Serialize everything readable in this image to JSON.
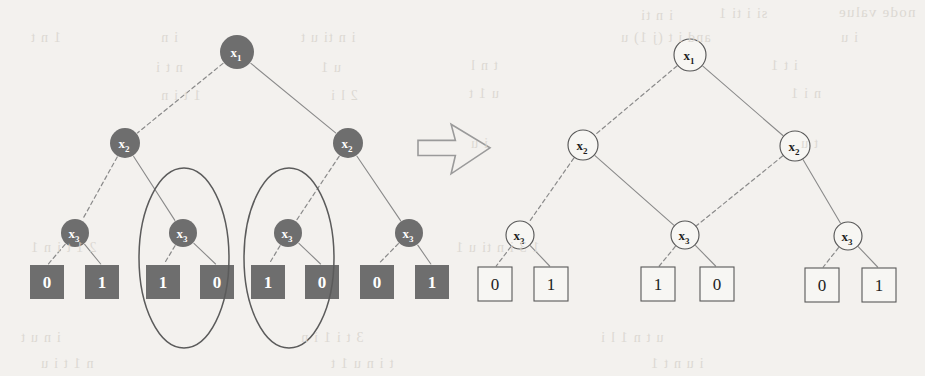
{
  "figure": {
    "colors": {
      "page_background": "#f3f1ee",
      "filled_node": "#6e6e6e",
      "filled_node_text": "#ffffff",
      "hollow_node_stroke": "#585858",
      "hollow_node_text": "#1d1d1d",
      "edge": "#8a8a8a",
      "ellipse_stroke": "#5b5b5b",
      "arrow_stroke": "#9a9a9a",
      "ghost_text": "#d9d5cf"
    },
    "arrow": {
      "name": "transform-arrow",
      "glyph": "right-arrow",
      "x": 418,
      "y": 122,
      "width": 72,
      "height": 54
    },
    "left_tree": {
      "name": "unreduced-decision-tree",
      "style": "filled",
      "nodes": [
        {
          "id": "L_root",
          "label": "x",
          "sub": "1",
          "cx": 237,
          "cy": 52,
          "r": 17
        },
        {
          "id": "L_x2a",
          "label": "x",
          "sub": "2",
          "cx": 125,
          "cy": 143,
          "r": 15
        },
        {
          "id": "L_x2b",
          "label": "x",
          "sub": "2",
          "cx": 348,
          "cy": 143,
          "r": 15
        },
        {
          "id": "L_x3a",
          "label": "x",
          "sub": "3",
          "cx": 75,
          "cy": 233,
          "r": 14
        },
        {
          "id": "L_x3b",
          "label": "x",
          "sub": "3",
          "cx": 183,
          "cy": 233,
          "r": 14
        },
        {
          "id": "L_x3c",
          "label": "x",
          "sub": "3",
          "cx": 288,
          "cy": 233,
          "r": 14
        },
        {
          "id": "L_x3d",
          "label": "x",
          "sub": "3",
          "cx": 409,
          "cy": 233,
          "r": 14
        }
      ],
      "leaves": [
        {
          "id": "L_t0",
          "value": "0",
          "x": 30,
          "y": 265,
          "w": 34,
          "h": 34
        },
        {
          "id": "L_t1",
          "value": "1",
          "x": 85,
          "y": 265,
          "w": 34,
          "h": 34
        },
        {
          "id": "L_t2",
          "value": "1",
          "x": 146,
          "y": 265,
          "w": 34,
          "h": 34
        },
        {
          "id": "L_t3",
          "value": "0",
          "x": 200,
          "y": 265,
          "w": 34,
          "h": 34
        },
        {
          "id": "L_t4",
          "value": "1",
          "x": 251,
          "y": 265,
          "w": 34,
          "h": 34
        },
        {
          "id": "L_t5",
          "value": "0",
          "x": 305,
          "y": 265,
          "w": 34,
          "h": 34
        },
        {
          "id": "L_t6",
          "value": "0",
          "x": 360,
          "y": 265,
          "w": 34,
          "h": 34
        },
        {
          "id": "L_t7",
          "value": "1",
          "x": 415,
          "y": 265,
          "w": 34,
          "h": 34
        }
      ],
      "edges": [
        {
          "from": "L_root",
          "to": "L_x2a",
          "style": "dashed",
          "branch": "0"
        },
        {
          "from": "L_root",
          "to": "L_x2b",
          "style": "solid",
          "branch": "1"
        },
        {
          "from": "L_x2a",
          "to": "L_x3a",
          "style": "dashed",
          "branch": "0"
        },
        {
          "from": "L_x2a",
          "to": "L_x3b",
          "style": "solid",
          "branch": "1"
        },
        {
          "from": "L_x2b",
          "to": "L_x3c",
          "style": "dashed",
          "branch": "0"
        },
        {
          "from": "L_x2b",
          "to": "L_x3d",
          "style": "solid",
          "branch": "1"
        },
        {
          "from": "L_x3a",
          "to": "L_t0",
          "style": "dashed",
          "branch": "0"
        },
        {
          "from": "L_x3a",
          "to": "L_t1",
          "style": "solid",
          "branch": "1"
        },
        {
          "from": "L_x3b",
          "to": "L_t2",
          "style": "dashed",
          "branch": "0"
        },
        {
          "from": "L_x3b",
          "to": "L_t3",
          "style": "solid",
          "branch": "1"
        },
        {
          "from": "L_x3c",
          "to": "L_t4",
          "style": "dashed",
          "branch": "0"
        },
        {
          "from": "L_x3c",
          "to": "L_t5",
          "style": "solid",
          "branch": "1"
        },
        {
          "from": "L_x3d",
          "to": "L_t6",
          "style": "dashed",
          "branch": "0"
        },
        {
          "from": "L_x3d",
          "to": "L_t7",
          "style": "solid",
          "branch": "1"
        }
      ],
      "highlight_ellipses": [
        {
          "id": "ellipse-left",
          "cx": 184,
          "cy": 258,
          "rx": 45,
          "ry": 90
        },
        {
          "id": "ellipse-right",
          "cx": 289,
          "cy": 258,
          "rx": 45,
          "ry": 90
        }
      ]
    },
    "right_tree": {
      "name": "reduced-decision-diagram",
      "style": "hollow",
      "nodes": [
        {
          "id": "R_root",
          "label": "x",
          "sub": "1",
          "cx": 690,
          "cy": 55,
          "r": 16
        },
        {
          "id": "R_x2a",
          "label": "x",
          "sub": "2",
          "cx": 583,
          "cy": 145,
          "r": 15
        },
        {
          "id": "R_x2b",
          "label": "x",
          "sub": "2",
          "cx": 795,
          "cy": 146,
          "r": 15
        },
        {
          "id": "R_x3a",
          "label": "x",
          "sub": "3",
          "cx": 520,
          "cy": 235,
          "r": 14
        },
        {
          "id": "R_x3b",
          "label": "x",
          "sub": "3",
          "cx": 685,
          "cy": 235,
          "r": 14
        },
        {
          "id": "R_x3c",
          "label": "x",
          "sub": "3",
          "cx": 848,
          "cy": 236,
          "r": 14
        }
      ],
      "leaves": [
        {
          "id": "R_t0",
          "value": "0",
          "x": 478,
          "y": 267,
          "w": 34,
          "h": 34
        },
        {
          "id": "R_t1",
          "value": "1",
          "x": 534,
          "y": 267,
          "w": 34,
          "h": 34
        },
        {
          "id": "R_t2",
          "value": "1",
          "x": 641,
          "y": 267,
          "w": 34,
          "h": 34
        },
        {
          "id": "R_t3",
          "value": "0",
          "x": 700,
          "y": 267,
          "w": 34,
          "h": 34
        },
        {
          "id": "R_t4",
          "value": "0",
          "x": 805,
          "y": 268,
          "w": 34,
          "h": 34
        },
        {
          "id": "R_t5",
          "value": "1",
          "x": 862,
          "y": 268,
          "w": 34,
          "h": 34
        }
      ],
      "edges": [
        {
          "from": "R_root",
          "to": "R_x2a",
          "style": "dashed",
          "branch": "0"
        },
        {
          "from": "R_root",
          "to": "R_x2b",
          "style": "solid",
          "branch": "1"
        },
        {
          "from": "R_x2a",
          "to": "R_x3a",
          "style": "dashed",
          "branch": "0"
        },
        {
          "from": "R_x2a",
          "to": "R_x3b",
          "style": "solid",
          "branch": "1"
        },
        {
          "from": "R_x2b",
          "to": "R_x3b",
          "style": "dashed",
          "branch": "0"
        },
        {
          "from": "R_x2b",
          "to": "R_x3c",
          "style": "solid",
          "branch": "1"
        },
        {
          "from": "R_x3a",
          "to": "R_t0",
          "style": "dashed",
          "branch": "0"
        },
        {
          "from": "R_x3a",
          "to": "R_t1",
          "style": "solid",
          "branch": "1"
        },
        {
          "from": "R_x3b",
          "to": "R_t2",
          "style": "dashed",
          "branch": "0"
        },
        {
          "from": "R_x3b",
          "to": "R_t3",
          "style": "solid",
          "branch": "1"
        },
        {
          "from": "R_x3c",
          "to": "R_t4",
          "style": "dashed",
          "branch": "0"
        },
        {
          "from": "R_x3c",
          "to": "R_t5",
          "style": "solid",
          "branch": "1"
        }
      ]
    },
    "ghost_text_lines": [
      {
        "text": "node value",
        "x": 838,
        "y": 4,
        "size": 15
      },
      {
        "text": "si  i  ti  1",
        "x": 718,
        "y": 6,
        "size": 14
      },
      {
        "text": "i  n  ti",
        "x": 640,
        "y": 8,
        "size": 14
      },
      {
        "text": "and i t (j  1)  u",
        "x": 620,
        "y": 30,
        "size": 14
      },
      {
        "text": "i u",
        "x": 840,
        "y": 30,
        "size": 14
      },
      {
        "text": "t  n  l",
        "x": 470,
        "y": 58,
        "size": 14
      },
      {
        "text": "i  t  1",
        "x": 770,
        "y": 58,
        "size": 14
      },
      {
        "text": "u  1  t",
        "x": 468,
        "y": 86,
        "size": 14
      },
      {
        "text": "n  i  1",
        "x": 790,
        "y": 86,
        "size": 14
      },
      {
        "text": "i  u",
        "x": 470,
        "y": 136,
        "size": 14
      },
      {
        "text": "t  u",
        "x": 800,
        "y": 136,
        "size": 14
      },
      {
        "text": "1    n   t",
        "x": 30,
        "y": 30,
        "size": 14
      },
      {
        "text": "i  n",
        "x": 160,
        "y": 30,
        "size": 14
      },
      {
        "text": "i  n  ti  u  t",
        "x": 300,
        "y": 30,
        "size": 14
      },
      {
        "text": "n  t  i",
        "x": 155,
        "y": 60,
        "size": 14
      },
      {
        "text": "u  1",
        "x": 320,
        "y": 60,
        "size": 14
      },
      {
        "text": "1  t  i  n",
        "x": 160,
        "y": 88,
        "size": 14
      },
      {
        "text": "2  l  i",
        "x": 330,
        "y": 88,
        "size": 14
      },
      {
        "text": "1  3  i  n  ti  u  1",
        "x": 455,
        "y": 240,
        "size": 14
      },
      {
        "text": "2  1  t  i  n  1",
        "x": 30,
        "y": 240,
        "size": 14
      },
      {
        "text": "i  n  u  t",
        "x": 20,
        "y": 330,
        "size": 14
      },
      {
        "text": "3  t  i  1  i  n",
        "x": 300,
        "y": 330,
        "size": 14
      },
      {
        "text": "u  t  n  1  l  i",
        "x": 600,
        "y": 330,
        "size": 14
      },
      {
        "text": "n  1  t  i  u",
        "x": 40,
        "y": 356,
        "size": 14
      },
      {
        "text": "t  i  n  u  1  t",
        "x": 330,
        "y": 356,
        "size": 14
      },
      {
        "text": "i  u  n  t  1",
        "x": 650,
        "y": 356,
        "size": 14
      }
    ]
  }
}
